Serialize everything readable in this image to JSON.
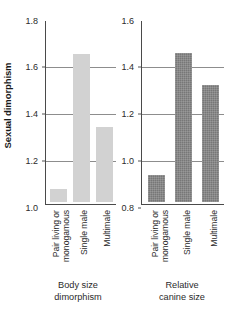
{
  "chart_data": {
    "type": "bar",
    "title": "",
    "ylabel": "Sexual dimorphism",
    "xlabel": "",
    "grid": true,
    "legend": "none",
    "categories": [
      "Pair living or monogamous",
      "Single male",
      "Multimale"
    ],
    "panels": [
      {
        "name": "body-size",
        "caption_line1": "Body size",
        "caption_line2": "dimorphism",
        "ylim": [
          1.0,
          1.8
        ],
        "yticks": [
          "1.0",
          "1.2",
          "1.4",
          "1.6",
          "1.8"
        ],
        "ytick_values": [
          1.0,
          1.2,
          1.4,
          1.6,
          1.8
        ],
        "gridlines_at": [
          1.2,
          1.4,
          1.6
        ],
        "bar_color": "#d2d2d2",
        "categories": [
          {
            "line1": "Pair living or",
            "line2": "monogamous"
          },
          {
            "line1": "Single male",
            "line2": ""
          },
          {
            "line1": "Multimale",
            "line2": ""
          }
        ],
        "values": [
          1.06,
          1.645,
          1.33
        ]
      },
      {
        "name": "relative-canine-size",
        "caption_line1": "Relative",
        "caption_line2": "canine size",
        "ylim": [
          0.8,
          1.6
        ],
        "yticks": [
          "0.8",
          "1.0",
          "1.2",
          "1.4",
          "1.6"
        ],
        "ytick_values": [
          0.8,
          1.0,
          1.2,
          1.4,
          1.6
        ],
        "gridlines_at": [
          1.0,
          1.2,
          1.4
        ],
        "bar_color": "#777777",
        "categories": [
          {
            "line1": "Pair living or",
            "line2": "monogamous"
          },
          {
            "line1": "Single male",
            "line2": ""
          },
          {
            "line1": "Multimale",
            "line2": ""
          }
        ],
        "values": [
          0.92,
          1.45,
          1.31
        ]
      }
    ]
  },
  "axis": {
    "y_title": "Sexual dimorphism"
  },
  "panel_body": {
    "tick0": "1.0",
    "tick1": "1.2",
    "tick2": "1.4",
    "tick3": "1.6",
    "tick4": "1.8",
    "cat0_l1": "Pair living or",
    "cat0_l2": "monogamous",
    "cat1_l1": "Single male",
    "cat2_l1": "Multimale",
    "caption_l1": "Body size",
    "caption_l2": "dimorphism"
  },
  "panel_canine": {
    "tick0": "0.8",
    "tick1": "1.0",
    "tick2": "1.2",
    "tick3": "1.4",
    "tick4": "1.6",
    "cat0_l1": "Pair living or",
    "cat0_l2": "monogamous",
    "cat1_l1": "Single male",
    "cat2_l1": "Multimale",
    "caption_l1": "Relative",
    "caption_l2": "canine size"
  },
  "colors": {
    "bar_light": "#d2d2d2",
    "bar_dark": "#777777",
    "axis": "#4a4a4a",
    "grid": "#8d8d8d",
    "text": "#2b2b2b"
  }
}
